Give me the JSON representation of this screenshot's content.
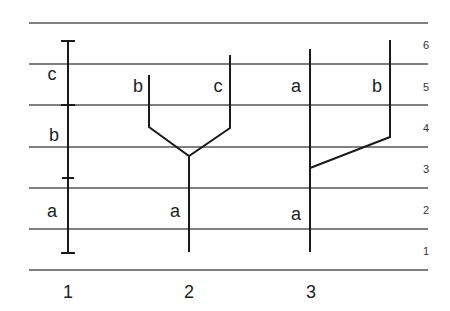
{
  "diagram": {
    "type": "phylogenetic-lineage-comparison",
    "line_color": "#1a1a1a",
    "grid_color": "#555555",
    "time_levels": [
      "1",
      "2",
      "3",
      "4",
      "5",
      "6"
    ],
    "columns": [
      {
        "label": "1",
        "segments": [
          {
            "label": "a",
            "from_level": 1,
            "to_level": 3
          },
          {
            "label": "b",
            "from_level": 3,
            "to_level": 5
          },
          {
            "label": "c",
            "from_level": 5,
            "to_level": 6
          }
        ]
      },
      {
        "label": "2",
        "stem": "a",
        "branches": [
          "b",
          "c"
        ],
        "split_level": 3.5
      },
      {
        "label": "3",
        "continuing": "a",
        "branch": "b",
        "branch_level": 3
      }
    ],
    "labels": {
      "col1_a": "a",
      "col1_b": "b",
      "col1_c": "c",
      "col2_a": "a",
      "col2_b": "b",
      "col2_c": "c",
      "col3_a_lower": "a",
      "col3_a_upper": "a",
      "col3_b": "b"
    }
  }
}
